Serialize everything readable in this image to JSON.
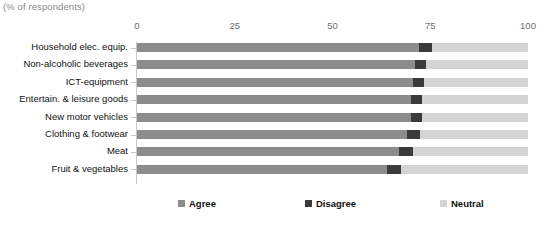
{
  "subtitle": "(% of respondents)",
  "colors": {
    "agree": "#8c8c8c",
    "disagree": "#3a3a3a",
    "neutral": "#d4d4d4",
    "axis": "#c9c9c9",
    "tick_text": "#6d6d6d",
    "label_text": "#111111",
    "subtitle_text": "#8a8a8a"
  },
  "legend": {
    "items": [
      {
        "label": "Agree",
        "color": "#8c8c8c",
        "x": 178
      },
      {
        "label": "Disagree",
        "color": "#3a3a3a",
        "x": 305
      },
      {
        "label": "Neutral",
        "color": "#d4d4d4",
        "x": 440
      }
    ]
  },
  "chart_data": {
    "type": "bar",
    "orientation": "horizontal",
    "stacked": true,
    "stacked_normalized": true,
    "title": "",
    "subtitle": "(% of respondents)",
    "xlabel": "",
    "ylabel": "",
    "xlim": [
      0,
      100
    ],
    "xticks": [
      0,
      25,
      50,
      75,
      100
    ],
    "xticklabels": [
      "0",
      "25",
      "50",
      "75",
      "100"
    ],
    "grid": false,
    "legend_position": "bottom",
    "categories": [
      "Household elec. equip.",
      "Non-alcoholic beverages",
      "ICT-equipment",
      "Entertain. & leisure goods",
      "New motor vehicles",
      "Clothing & footwear",
      "Meat",
      "Fruit & vegetables"
    ],
    "series": [
      {
        "name": "Agree",
        "color": "#8c8c8c",
        "values": [
          72,
          71,
          70.5,
          70,
          70,
          69,
          67,
          64
        ]
      },
      {
        "name": "Disagree",
        "color": "#3a3a3a",
        "values": [
          3.5,
          3,
          3,
          3,
          3,
          3.5,
          3.5,
          3.5
        ]
      },
      {
        "name": "Neutral",
        "color": "#d4d4d4",
        "values": [
          24.5,
          26,
          26.5,
          27,
          27,
          27.5,
          29.5,
          32.5
        ]
      }
    ]
  }
}
